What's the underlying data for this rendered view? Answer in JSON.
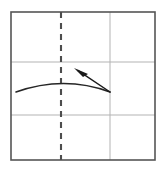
{
  "figure": {
    "title": "",
    "background_color": "#ffffff",
    "width": 163,
    "height": 171
  },
  "grid": {
    "border": {
      "color": "#555555",
      "stroke_width": 1.6,
      "x": 11,
      "y": 12,
      "width": 144,
      "height": 148
    },
    "gridline_color": "#b3b3b3",
    "gridline_width": 1,
    "horizontal_gridlines": [
      {
        "name": "upper-gridline",
        "y": 62
      },
      {
        "name": "lower-gridline",
        "y": 115
      }
    ],
    "vertical_gridlines": [
      {
        "name": "right-gridline",
        "x": 110
      }
    ],
    "dashed_axis": {
      "name": "center-dashed-line",
      "x": 61,
      "y1": 12,
      "y2": 160,
      "color": "#4d4d4d",
      "stroke_width": 2.1,
      "dash_length": 6,
      "gap_length": 5
    }
  },
  "annotations": {
    "curve": {
      "label": "arc-curve",
      "color": "#262626",
      "stroke_width": 1.5,
      "path": "M 16 92 Q 64 75 110 92"
    },
    "arrow": {
      "label": "up-left-arrow",
      "color": "#1a1a1a",
      "stroke_width": 1.5,
      "tail_x": 110,
      "tail_y": 92,
      "tip_x": 74,
      "tip_y": 68,
      "head_polygon": "74,68 88,74 83,77"
    }
  },
  "chart_data": {
    "type": "line",
    "title": "",
    "xlabel": "",
    "ylabel": "",
    "grid": true,
    "legend": null,
    "xlim": [
      0,
      3
    ],
    "ylim": [
      0,
      3
    ],
    "series": [
      {
        "name": "arc-curve",
        "x": [
          0.27,
          1.1,
          2.06
        ],
        "y": [
          1.38,
          1.72,
          1.38
        ]
      }
    ],
    "annotations": [
      {
        "type": "arrow",
        "text": "",
        "from_x": 2.06,
        "from_y": 1.38,
        "to_x": 1.31,
        "to_y": 1.86
      }
    ]
  }
}
